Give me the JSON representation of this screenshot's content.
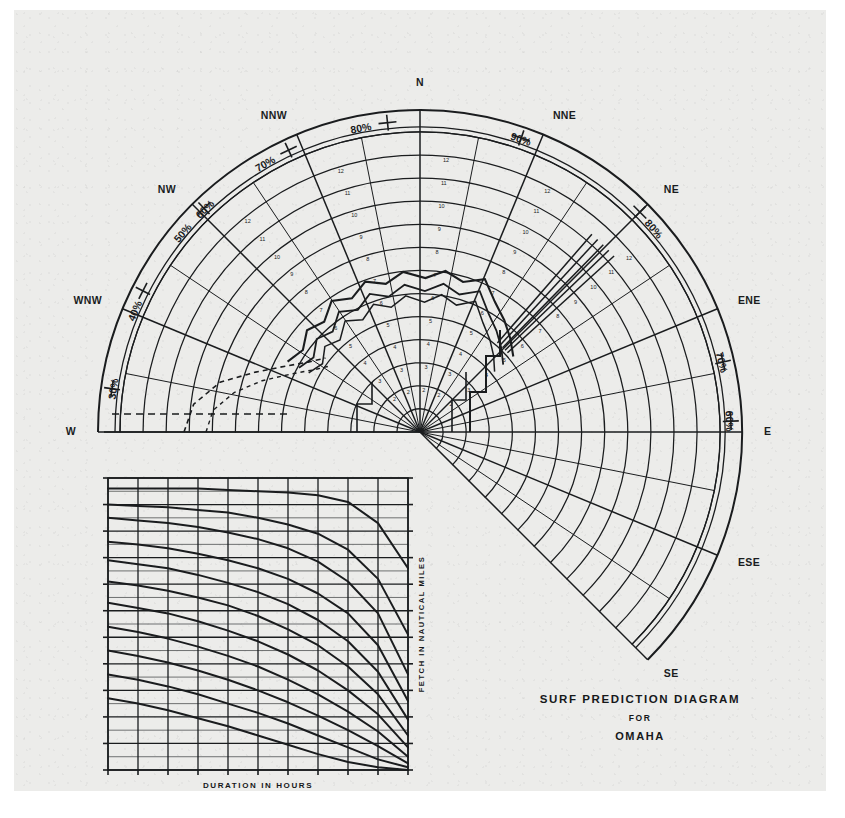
{
  "document": {
    "title_line1": "SURF  PREDICTION  DIAGRAM",
    "title_line2": "FOR",
    "title_line3": "OMAHA",
    "paper_color": "#ececea",
    "ink_color": "#1a1c1e"
  },
  "compass": {
    "center_label": "",
    "directions": [
      {
        "id": "n",
        "label": "N",
        "angle_deg": 0
      },
      {
        "id": "nne",
        "label": "NNE",
        "angle_deg": 22.5
      },
      {
        "id": "ne",
        "label": "NE",
        "angle_deg": 45
      },
      {
        "id": "ene",
        "label": "ENE",
        "angle_deg": 67.5
      },
      {
        "id": "e",
        "label": "E",
        "angle_deg": 90
      },
      {
        "id": "ese",
        "label": "ESE",
        "angle_deg": 112.5
      },
      {
        "id": "se",
        "label": "SE",
        "angle_deg": 135
      },
      {
        "id": "nnw",
        "label": "NNW",
        "angle_deg": -22.5
      },
      {
        "id": "nw",
        "label": "NW",
        "angle_deg": -45
      },
      {
        "id": "wnw",
        "label": "WNW",
        "angle_deg": -67.5
      },
      {
        "id": "w",
        "label": "W",
        "angle_deg": -90
      }
    ],
    "percent_band_labels": [
      {
        "id": "p30",
        "label": "30%",
        "angle_deg": -82
      },
      {
        "id": "p40",
        "label": "40%",
        "angle_deg": -67
      },
      {
        "id": "p50",
        "label": "50%",
        "angle_deg": -50
      },
      {
        "id": "p60w",
        "label": "60%",
        "angle_deg": -44
      },
      {
        "id": "p70",
        "label": "70%",
        "angle_deg": -30
      },
      {
        "id": "p80",
        "label": "80%",
        "angle_deg": -11
      },
      {
        "id": "p90",
        "label": "90%",
        "angle_deg": 19
      },
      {
        "id": "p80e",
        "label": "80%",
        "angle_deg": 49
      },
      {
        "id": "p70e",
        "label": "70%",
        "angle_deg": 77
      },
      {
        "id": "p60e",
        "label": "60%",
        "angle_deg": 88
      }
    ],
    "radial_tick_values": [
      "1",
      "2",
      "3",
      "4",
      "5",
      "6",
      "7",
      "8",
      "9",
      "10",
      "11",
      "12"
    ],
    "arc_count": 13,
    "notes": "Polar fan of radial direction lines with concentric range arcs; outer annulus carries percentage scale; irregular solid and dashed contours overlaid over the inner field."
  },
  "inset_chart": {
    "xlabel": "DURATION IN HOURS",
    "ylabel": "FETCH IN NAUTICAL MILES",
    "type": "line",
    "curve_count": 11,
    "x_major_ticks": 10,
    "y_major_ticks": 11,
    "notes": "Family of decaying curves, each flat at left then falling steeply toward the right edge."
  },
  "chart_data": {
    "type": "line",
    "title": "SURF  PREDICTION  DIAGRAM",
    "subtitle": "OMAHA",
    "xlabel": "DURATION IN HOURS",
    "ylabel": "FETCH IN NAUTICAL MILES",
    "grid": true,
    "legend": "none",
    "xlim": [
      0,
      10
    ],
    "ylim": [
      0,
      11
    ],
    "series": [
      {
        "name": "curve-1",
        "x": [
          0,
          1,
          2,
          3,
          4,
          5,
          6,
          7,
          8,
          9,
          10
        ],
        "values": [
          10.6,
          10.6,
          10.6,
          10.6,
          10.55,
          10.5,
          10.45,
          10.35,
          10.1,
          9.3,
          7.6
        ]
      },
      {
        "name": "curve-2",
        "x": [
          0,
          1,
          2,
          3,
          4,
          5,
          6,
          7,
          8,
          9,
          10
        ],
        "values": [
          10.0,
          9.95,
          9.9,
          9.8,
          9.7,
          9.5,
          9.25,
          8.9,
          8.3,
          7.2,
          5.1
        ]
      },
      {
        "name": "curve-3",
        "x": [
          0,
          1,
          2,
          3,
          4,
          5,
          6,
          7,
          8,
          9,
          10
        ],
        "values": [
          9.5,
          9.4,
          9.3,
          9.15,
          8.95,
          8.7,
          8.35,
          7.85,
          7.1,
          5.9,
          3.6
        ]
      },
      {
        "name": "curve-4",
        "x": [
          0,
          1,
          2,
          3,
          4,
          5,
          6,
          7,
          8,
          9,
          10
        ],
        "values": [
          8.6,
          8.5,
          8.35,
          8.15,
          7.9,
          7.6,
          7.2,
          6.65,
          5.9,
          4.7,
          2.6
        ]
      },
      {
        "name": "curve-5",
        "x": [
          0,
          1,
          2,
          3,
          4,
          5,
          6,
          7,
          8,
          9,
          10
        ],
        "values": [
          7.9,
          7.75,
          7.6,
          7.35,
          7.05,
          6.7,
          6.25,
          5.65,
          4.85,
          3.7,
          1.9
        ]
      },
      {
        "name": "curve-6",
        "x": [
          0,
          1,
          2,
          3,
          4,
          5,
          6,
          7,
          8,
          9,
          10
        ],
        "values": [
          7.1,
          6.95,
          6.75,
          6.5,
          6.2,
          5.8,
          5.3,
          4.7,
          3.9,
          2.85,
          1.3
        ]
      },
      {
        "name": "curve-7",
        "x": [
          0,
          1,
          2,
          3,
          4,
          5,
          6,
          7,
          8,
          9,
          10
        ],
        "values": [
          6.3,
          6.1,
          5.9,
          5.6,
          5.25,
          4.85,
          4.35,
          3.75,
          3.0,
          2.1,
          0.85
        ]
      },
      {
        "name": "curve-8",
        "x": [
          0,
          1,
          2,
          3,
          4,
          5,
          6,
          7,
          8,
          9,
          10
        ],
        "values": [
          5.4,
          5.2,
          4.95,
          4.65,
          4.3,
          3.9,
          3.4,
          2.85,
          2.2,
          1.45,
          0.5
        ]
      },
      {
        "name": "curve-9",
        "x": [
          0,
          1,
          2,
          3,
          4,
          5,
          6,
          7,
          8,
          9,
          10
        ],
        "values": [
          4.5,
          4.3,
          4.05,
          3.75,
          3.4,
          3.0,
          2.55,
          2.05,
          1.5,
          0.9,
          0.25
        ]
      },
      {
        "name": "curve-10",
        "x": [
          0,
          1,
          2,
          3,
          4,
          5,
          6,
          7,
          8,
          9,
          10
        ],
        "values": [
          3.6,
          3.4,
          3.15,
          2.85,
          2.5,
          2.15,
          1.75,
          1.3,
          0.85,
          0.4,
          0.1
        ]
      },
      {
        "name": "curve-11",
        "x": [
          0,
          1,
          2,
          3,
          4,
          5,
          6,
          7,
          8,
          9,
          10
        ],
        "values": [
          2.7,
          2.5,
          2.25,
          1.95,
          1.65,
          1.3,
          0.95,
          0.6,
          0.3,
          0.1,
          0.0
        ]
      }
    ]
  }
}
